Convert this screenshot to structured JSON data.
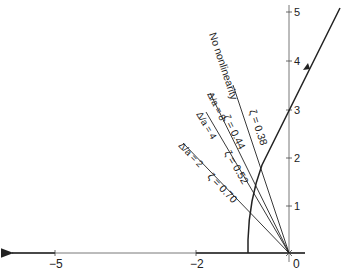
{
  "diagram": {
    "type": "root-locus",
    "axes": {
      "x_ticks": [
        {
          "value": -5,
          "label": "−5"
        },
        {
          "value": -2,
          "label": "−2"
        },
        {
          "value": 0,
          "label": "0"
        }
      ],
      "y_ticks": [
        {
          "value": 1,
          "label": "1"
        },
        {
          "value": 2,
          "label": "2"
        },
        {
          "value": 3,
          "label": "3"
        },
        {
          "value": 4,
          "label": "4"
        },
        {
          "value": 5,
          "label": "5"
        }
      ]
    },
    "rays": [
      {
        "id": "no-nonlinearity",
        "name_label": "No nonlinearity",
        "zeta_label": "ζ = 0.38"
      },
      {
        "id": "delta-8",
        "name_label": "Δ/a = 8",
        "zeta_label": "ζ = 0.44"
      },
      {
        "id": "delta-4",
        "name_label": "Δ/a = 4",
        "zeta_label": "ζ = 0.52"
      },
      {
        "id": "delta-2",
        "name_label": "Δ/a = 2",
        "zeta_label": "ζ = 0.70"
      }
    ],
    "colors": {
      "line": "#222222",
      "axis": "#555555",
      "background": "#ffffff"
    }
  }
}
